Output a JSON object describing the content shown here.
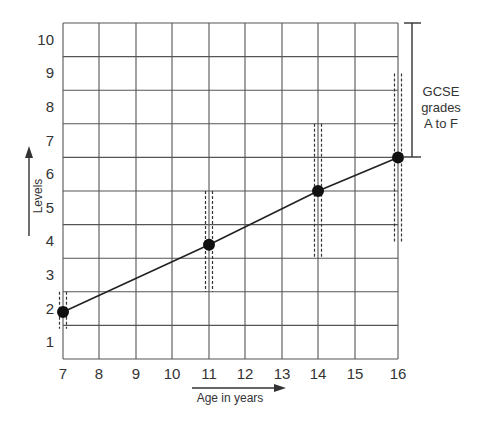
{
  "chart_data": {
    "type": "line",
    "title": "",
    "xlabel": "Age in years",
    "ylabel": "Levels",
    "x_ticks": [
      7,
      8,
      9,
      10,
      11,
      12,
      13,
      14,
      15,
      16
    ],
    "y_ticks": [
      1,
      2,
      3,
      4,
      5,
      6,
      7,
      8,
      9,
      10
    ],
    "xlim": [
      7,
      16
    ],
    "ylim": [
      0.5,
      10.5
    ],
    "grid": true,
    "series": [
      {
        "name": "Expected attainment",
        "x": [
          7,
          11,
          14,
          16
        ],
        "y": [
          1.9,
          3.9,
          5.5,
          6.5
        ],
        "ranges": [
          {
            "x": 7,
            "low": 1.4,
            "high": 2.5
          },
          {
            "x": 11,
            "low": 2.5,
            "high": 5.5
          },
          {
            "x": 14,
            "low": 3.5,
            "high": 7.5
          },
          {
            "x": 16,
            "low": 4.0,
            "high": 9.0
          }
        ]
      }
    ],
    "annotations": [
      {
        "text": "GCSE grades A to F",
        "bracket_from_level": 6.5,
        "bracket_to_level": 10.5
      }
    ]
  },
  "labels": {
    "x_axis": "Age in years",
    "y_axis": "Levels",
    "gcse_line1": "GCSE",
    "gcse_line2": "grades",
    "gcse_line3": "A to F",
    "x_ticks": [
      "7",
      "8",
      "9",
      "10",
      "11",
      "12",
      "13",
      "14",
      "15",
      "16"
    ],
    "y_ticks": [
      "1",
      "2",
      "3",
      "4",
      "5",
      "6",
      "7",
      "8",
      "9",
      "10"
    ]
  }
}
